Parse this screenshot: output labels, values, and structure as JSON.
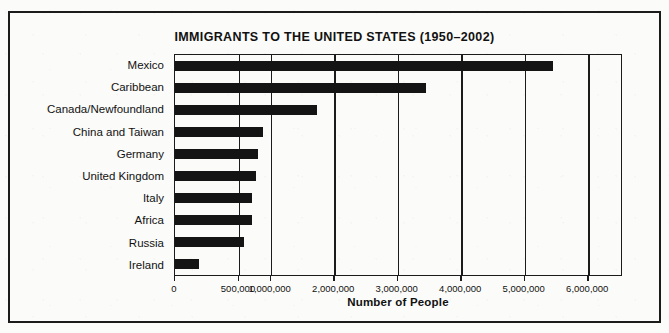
{
  "chart_data": {
    "type": "bar",
    "orientation": "horizontal",
    "title": "IMMIGRANTS TO THE UNITED STATES (1950–2002)",
    "xlabel": "Number of People",
    "ylabel": "",
    "grid": true,
    "legend": null,
    "xlim": [
      0,
      6300000
    ],
    "tick_labels": [
      "0",
      "500,000",
      "1,000,000",
      "2,000,000",
      "3,000,000",
      "4,000,000",
      "5,000,000",
      "6,000,000"
    ],
    "tick_values": [
      0,
      500000,
      1000000,
      2000000,
      3000000,
      4000000,
      5000000,
      6000000
    ],
    "categories": [
      "Mexico",
      "Caribbean",
      "Canada/Newfoundland",
      "China and Taiwan",
      "Germany",
      "United Kingdom",
      "Italy",
      "Africa",
      "Russia",
      "Ireland"
    ],
    "values": [
      5450000,
      3450000,
      1730000,
      880000,
      800000,
      760000,
      700000,
      700000,
      580000,
      190000
    ],
    "bar_color": "#141414",
    "axis_color": "#1b1b1b",
    "background": "#fbfbf9"
  }
}
